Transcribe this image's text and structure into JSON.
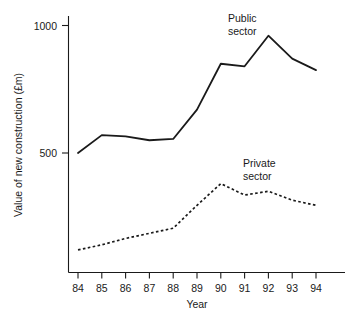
{
  "chart_data": {
    "type": "line",
    "title": "",
    "xlabel": "Year",
    "ylabel": "Value of new construction (£m)",
    "categories": [
      "84",
      "85",
      "86",
      "87",
      "88",
      "89",
      "90",
      "91",
      "92",
      "93",
      "94"
    ],
    "x_tick_labels": [
      "84",
      "85",
      "86",
      "87",
      "88",
      "89",
      "90",
      "91",
      "92",
      "93",
      "94"
    ],
    "y_tick_labels": [
      "500",
      "1000"
    ],
    "y_tick_values": [
      500,
      1000
    ],
    "ylim": [
      0,
      1075
    ],
    "xlim": [
      83.5,
      94.9
    ],
    "grid": false,
    "legend_position": "inline-annotation",
    "series": [
      {
        "name": "Public sector",
        "style": "solid",
        "values": [
          500,
          570,
          565,
          550,
          555,
          670,
          850,
          840,
          960,
          870,
          825
        ]
      },
      {
        "name": "Private sector",
        "style": "dashed",
        "values": [
          120,
          140,
          165,
          185,
          205,
          295,
          380,
          335,
          350,
          315,
          295
        ]
      }
    ],
    "annotations": [
      {
        "id": "public-label",
        "line1": "Public",
        "line2": "sector"
      },
      {
        "id": "private-label",
        "line1": "Private",
        "line2": "sector"
      }
    ]
  },
  "axes": {
    "y_label": "Value of new construction (£m)",
    "x_label": "Year",
    "y_ticks": [
      {
        "label": "1000",
        "value": 1000
      },
      {
        "label": "500",
        "value": 500
      }
    ],
    "x_ticks": [
      {
        "label": "84"
      },
      {
        "label": "85"
      },
      {
        "label": "86"
      },
      {
        "label": "87"
      },
      {
        "label": "88"
      },
      {
        "label": "89"
      },
      {
        "label": "90"
      },
      {
        "label": "91"
      },
      {
        "label": "92"
      },
      {
        "label": "93"
      },
      {
        "label": "94"
      }
    ]
  },
  "labels": {
    "public_line1": "Public",
    "public_line2": "sector",
    "private_line1": "Private",
    "private_line2": "sector"
  },
  "colors": {
    "ink": "#1a1a1a",
    "background": "#ffffff"
  }
}
